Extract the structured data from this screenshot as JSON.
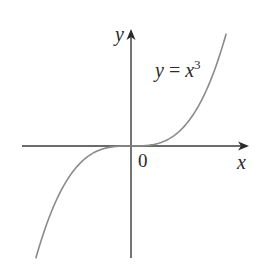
{
  "chart_data": {
    "type": "line",
    "title": "",
    "function": "y = x^3",
    "series": [
      {
        "name": "y = x^3",
        "x": [
          -1.6,
          -1.4,
          -1.2,
          -1.0,
          -0.8,
          -0.6,
          -0.4,
          -0.2,
          0,
          0.2,
          0.4,
          0.6,
          0.8,
          1.0,
          1.2,
          1.4,
          1.6
        ],
        "y": [
          -4.096,
          -2.744,
          -1.728,
          -1.0,
          -0.512,
          -0.216,
          -0.064,
          -0.008,
          0,
          0.008,
          0.064,
          0.216,
          0.512,
          1.0,
          1.728,
          2.744,
          4.096
        ]
      }
    ],
    "xlabel": "x",
    "ylabel": "y",
    "annotations": [
      "y = x^3",
      "0"
    ],
    "grid": false,
    "legend": "none",
    "xlim": [
      -1.8,
      1.9
    ],
    "ylim": [
      -4.1,
      4.2
    ],
    "colors": {
      "curve": "#8a8a8a",
      "axes": "#3a3a3a",
      "text": "#2a2a2a"
    }
  },
  "labels": {
    "y_axis": "y",
    "x_axis": "x",
    "origin": "0",
    "equation_lhs": "y",
    "equation_eq": " = ",
    "equation_base": "x",
    "equation_exp": "3"
  }
}
